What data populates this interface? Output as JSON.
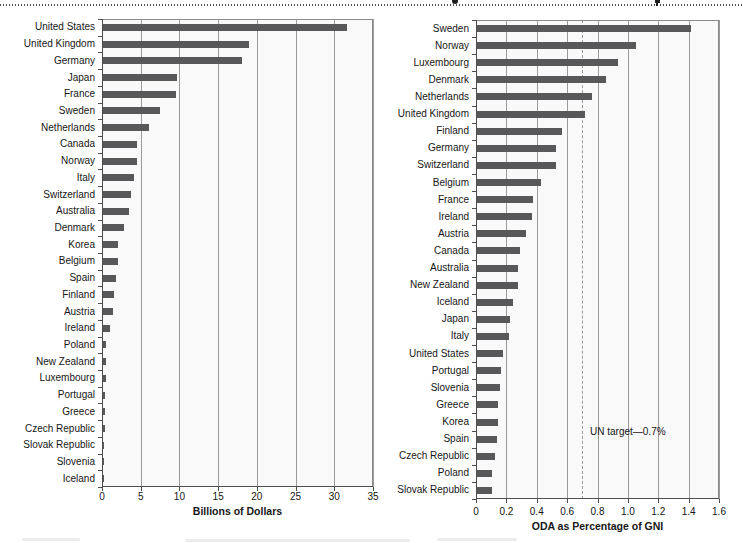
{
  "colors": {
    "bar": "#58585a",
    "gridline": "#9b9b9b",
    "frame": "#8a8a8a",
    "axis_line": "#4d4d4d",
    "reference_line": "#9a9a9a",
    "text": "#161616"
  },
  "chart_data": [
    {
      "type": "bar",
      "orientation": "horizontal",
      "title": "",
      "xlabel": "Billions of Dollars",
      "ylabel": "",
      "xlim": [
        0,
        35
      ],
      "xticks": [
        0,
        5,
        10,
        15,
        20,
        25,
        30,
        35
      ],
      "xtick_labels": [
        "0",
        "5",
        "10",
        "15",
        "20",
        "25",
        "30",
        "35"
      ],
      "grid": true,
      "categories": [
        "United States",
        "United Kingdom",
        "Germany",
        "Japan",
        "France",
        "Sweden",
        "Netherlands",
        "Canada",
        "Norway",
        "Italy",
        "Switzerland",
        "Australia",
        "Denmark",
        "Korea",
        "Belgium",
        "Spain",
        "Finland",
        "Austria",
        "Ireland",
        "Poland",
        "New Zealand",
        "Luxembourg",
        "Portugal",
        "Greece",
        "Czech Republic",
        "Slovak Republic",
        "Slovenia",
        "Iceland"
      ],
      "values": [
        31.5,
        18.9,
        18.0,
        9.5,
        9.4,
        7.3,
        6.0,
        4.4,
        4.35,
        4.0,
        3.65,
        3.3,
        2.7,
        2.0,
        1.95,
        1.7,
        1.4,
        1.35,
        0.85,
        0.44,
        0.44,
        0.36,
        0.31,
        0.25,
        0.2,
        0.1,
        0.06,
        0.04
      ]
    },
    {
      "type": "bar",
      "orientation": "horizontal",
      "title": "",
      "xlabel": "ODA as Percentage of GNI",
      "ylabel": "",
      "xlim": [
        0,
        1.6
      ],
      "xticks": [
        0,
        0.2,
        0.4,
        0.6,
        0.8,
        1.0,
        1.2,
        1.4,
        1.6
      ],
      "xtick_labels": [
        "0",
        "0.2",
        "0.4",
        "0.6",
        "0.8",
        "1.0",
        "1.2",
        "1.4",
        "1.6"
      ],
      "grid": true,
      "categories": [
        "Sweden",
        "Norway",
        "Luxembourg",
        "Denmark",
        "Netherlands",
        "United Kingdom",
        "Finland",
        "Germany",
        "Switzerland",
        "Belgium",
        "France",
        "Ireland",
        "Austria",
        "Canada",
        "Australia",
        "New Zealand",
        "Iceland",
        "Japan",
        "Italy",
        "United States",
        "Portugal",
        "Slovenia",
        "Greece",
        "Korea",
        "Spain",
        "Czech Republic",
        "Poland",
        "Slovak Republic"
      ],
      "values": [
        1.41,
        1.05,
        0.93,
        0.85,
        0.76,
        0.71,
        0.56,
        0.52,
        0.52,
        0.42,
        0.37,
        0.36,
        0.32,
        0.28,
        0.27,
        0.27,
        0.24,
        0.22,
        0.21,
        0.17,
        0.16,
        0.15,
        0.14,
        0.14,
        0.13,
        0.12,
        0.1,
        0.1
      ],
      "reference_line": {
        "value": 0.7,
        "label": "UN target—0.7%",
        "style": "dashed"
      }
    }
  ]
}
